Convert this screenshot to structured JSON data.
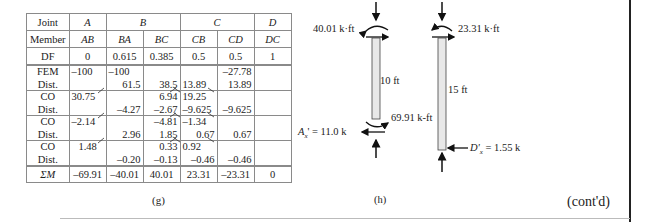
{
  "table": {
    "joint_row": {
      "label": "Joint",
      "A": "A",
      "B": "B",
      "C": "C",
      "D": "D"
    },
    "member_row": {
      "label": "Member",
      "cells": [
        "AB",
        "BA",
        "BC",
        "CB",
        "CD",
        "DC"
      ]
    },
    "df_row": {
      "label": "DF",
      "cells": [
        "0",
        "0.615",
        "0.385",
        "0.5",
        "0.5",
        "1"
      ]
    },
    "blocks": [
      {
        "label1": "FEM",
        "label2": "Dist.",
        "cells": [
          [
            "-100",
            ""
          ],
          [
            "-100",
            "61.5"
          ],
          [
            "",
            "38.5"
          ],
          [
            "",
            "13.89"
          ],
          [
            "-27.78",
            "13.89"
          ],
          [
            "",
            ""
          ]
        ]
      },
      {
        "label1": "CO",
        "label2": "Dist.",
        "cells": [
          [
            "30.75",
            ""
          ],
          [
            "",
            "-4.27"
          ],
          [
            "6.94",
            "-2.67"
          ],
          [
            "19.25",
            "-9.625"
          ],
          [
            "",
            "-9.625"
          ],
          [
            "",
            ""
          ]
        ]
      },
      {
        "label1": "CO",
        "label2": "Dist.",
        "cells": [
          [
            "-2.14",
            ""
          ],
          [
            "",
            "2.96"
          ],
          [
            "-4.81",
            "1.85"
          ],
          [
            "-1.34",
            "0.67"
          ],
          [
            "",
            "0.67"
          ],
          [
            "",
            ""
          ]
        ]
      },
      {
        "label1": "CO",
        "label2": "Dist.",
        "cells": [
          [
            "1.48",
            ""
          ],
          [
            "",
            "-0.20"
          ],
          [
            "0.33",
            "-0.13"
          ],
          [
            "0.92",
            "-0.46"
          ],
          [
            "",
            "-0.46"
          ],
          [
            "",
            ""
          ]
        ]
      }
    ],
    "sum_row": {
      "label": "ΣM",
      "cells": [
        "-69.91",
        "-40.01",
        "40.01",
        "23.31",
        "-23.31",
        "0"
      ]
    },
    "caption": "(g)"
  },
  "diagram": {
    "member1": {
      "top_moment": "40.01 k·ft",
      "length": "10 ft",
      "bottom_moment": "69.91 k-ft",
      "reaction": "A",
      "reaction_sub": "x",
      "reaction_value": "' = 11.0 k"
    },
    "member2": {
      "top_moment": "23.31 k·ft",
      "length": "15 ft",
      "reaction": "D'",
      "reaction_sub": "x",
      "reaction_value": " = 1.55 k"
    },
    "caption": "(h)"
  },
  "footer": {
    "continued": "(cont'd)"
  }
}
